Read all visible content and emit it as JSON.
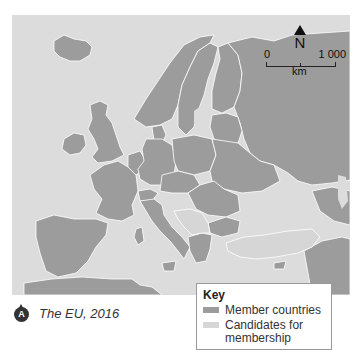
{
  "map": {
    "title": "The EU, 2016",
    "badge_letter": "A",
    "north_label": "N",
    "scale": {
      "min_label": "0",
      "max_label": "1 000",
      "unit": "km"
    },
    "colors": {
      "sea": "#dcdcdc",
      "member": "#9c9c9c",
      "non_member": "#9c9c9c",
      "candidate": "#d3d3d3",
      "border": "#ffffff"
    }
  },
  "key": {
    "title": "Key",
    "items": [
      {
        "label": "Member countries",
        "color": "#9c9c9c"
      },
      {
        "label": "Candidates for membership",
        "color": "#d3d3d3"
      }
    ]
  }
}
